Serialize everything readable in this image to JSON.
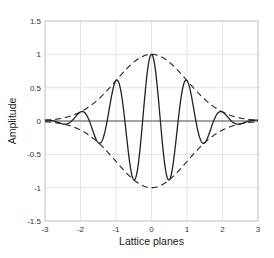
{
  "chart_data": {
    "type": "line",
    "title": "",
    "xlabel": "Lattice planes",
    "ylabel": "Amplitude",
    "xlim": [
      -3,
      3
    ],
    "ylim": [
      -1.5,
      1.5
    ],
    "xticks": [
      -3,
      -2,
      -1,
      0,
      1,
      2,
      3
    ],
    "xtick_labels": [
      "-3",
      "-2",
      "-1",
      "0",
      "1",
      "2",
      "3"
    ],
    "yticks": [
      -1.5,
      -1,
      -0.5,
      0,
      0.5,
      1,
      1.5
    ],
    "ytick_labels": [
      "-1.5",
      "-1",
      "-0.5",
      "0",
      "0.5",
      "1",
      "1.5"
    ],
    "grid": true,
    "legend": null,
    "series": [
      {
        "name": "wave packet",
        "style": "solid",
        "color": "#222222",
        "formula": "exp(-x^2/(2*sigma^2)) * cos(2*pi*freq*x)",
        "params": {
          "sigma": 1,
          "freq": 1
        },
        "x": [
          -3,
          -2.75,
          -2.5,
          -2.25,
          -2,
          -1.75,
          -1.5,
          -1.25,
          -1,
          -0.75,
          -0.5,
          -0.25,
          0,
          0.25,
          0.5,
          0.75,
          1,
          1.25,
          1.5,
          1.75,
          2,
          2.25,
          2.5,
          2.75,
          3
        ],
        "values": [
          0.011,
          0,
          -0.044,
          0,
          0.135,
          0,
          -0.325,
          0,
          0.607,
          0,
          -0.882,
          0,
          1,
          0,
          -0.882,
          0,
          0.607,
          0,
          -0.325,
          0,
          0.135,
          0,
          -0.044,
          0,
          0.011
        ]
      },
      {
        "name": "upper envelope",
        "style": "dashed",
        "color": "#222222",
        "formula": "exp(-x^2/(2*sigma^2))",
        "params": {
          "sigma": 1,
          "sign": 1
        },
        "x": [
          -3,
          -2.5,
          -2,
          -1.5,
          -1,
          -0.5,
          0,
          0.5,
          1,
          1.5,
          2,
          2.5,
          3
        ],
        "values": [
          0.011,
          0.044,
          0.135,
          0.325,
          0.607,
          0.882,
          1,
          0.882,
          0.607,
          0.325,
          0.135,
          0.044,
          0.011
        ]
      },
      {
        "name": "lower envelope",
        "style": "dashed",
        "color": "#222222",
        "formula": "-exp(-x^2/(2*sigma^2))",
        "params": {
          "sigma": 1,
          "sign": -1
        },
        "x": [
          -3,
          -2.5,
          -2,
          -1.5,
          -1,
          -0.5,
          0,
          0.5,
          1,
          1.5,
          2,
          2.5,
          3
        ],
        "values": [
          -0.011,
          -0.044,
          -0.135,
          -0.325,
          -0.607,
          -0.882,
          -1,
          -0.882,
          -0.607,
          -0.325,
          -0.135,
          -0.044,
          -0.011
        ]
      }
    ],
    "zero_line": {
      "y": 0,
      "color": "#444444"
    }
  },
  "colors": {
    "grid": "#e4e4e4",
    "frame": "#cccccc",
    "line": "#222222"
  }
}
